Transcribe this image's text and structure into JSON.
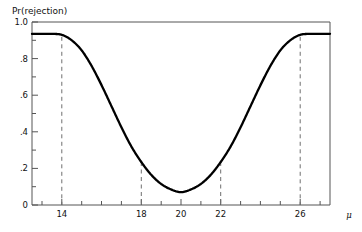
{
  "figure": {
    "background_color": "#ffffff",
    "frame_color": "#4a4a4a",
    "curve_color": "#000000",
    "dash_color": "#6e6e6e",
    "ylabel_top": "Pr(rejection)",
    "xlabel": "μ"
  },
  "chart_data": {
    "type": "line",
    "title": "",
    "subtitle": "",
    "xlabel": "μ",
    "ylabel": "Pr(rejection)",
    "xlim": [
      12.5,
      27.5
    ],
    "ylim": [
      0.0,
      1.0
    ],
    "grid": false,
    "legend": "none",
    "x_ticks_major": [
      14,
      18,
      20,
      22,
      26
    ],
    "x_tick_labels": [
      "14",
      "18",
      "20",
      "22",
      "26"
    ],
    "x_ticks_minor": [
      13,
      15,
      16,
      17,
      19,
      21,
      23,
      24,
      25,
      27
    ],
    "y_ticks_major": [
      0.0,
      0.2,
      0.4,
      0.6,
      0.8,
      1.0
    ],
    "y_tick_labels": [
      "0",
      ".2",
      ".4",
      ".6",
      ".8",
      "1.0"
    ],
    "y_ticks_minor": [
      0.1,
      0.3,
      0.5,
      0.7,
      0.9
    ],
    "annotations": [
      {
        "name": "dashed-line-14",
        "type": "vline",
        "x": 14,
        "style": "dashed"
      },
      {
        "name": "dashed-line-18",
        "type": "vline",
        "x": 18,
        "style": "dashed"
      },
      {
        "name": "dashed-line-22",
        "type": "vline",
        "x": 22,
        "style": "dashed"
      },
      {
        "name": "dashed-line-26",
        "type": "vline",
        "x": 26,
        "style": "dashed"
      }
    ],
    "series": [
      {
        "name": "power",
        "x": [
          12.5,
          13.0,
          13.5,
          14.0,
          14.5,
          15.0,
          15.5,
          16.0,
          16.5,
          17.0,
          17.5,
          18.0,
          18.5,
          19.0,
          19.5,
          20.0,
          20.5,
          21.0,
          21.5,
          22.0,
          22.5,
          23.0,
          23.5,
          24.0,
          24.5,
          25.0,
          25.5,
          26.0,
          26.5,
          27.0,
          27.5
        ],
        "y": [
          0.935,
          0.935,
          0.935,
          0.93,
          0.9,
          0.845,
          0.76,
          0.655,
          0.54,
          0.425,
          0.32,
          0.235,
          0.165,
          0.115,
          0.085,
          0.07,
          0.085,
          0.115,
          0.165,
          0.235,
          0.32,
          0.425,
          0.54,
          0.655,
          0.76,
          0.845,
          0.9,
          0.93,
          0.935,
          0.935,
          0.935
        ]
      }
    ]
  }
}
